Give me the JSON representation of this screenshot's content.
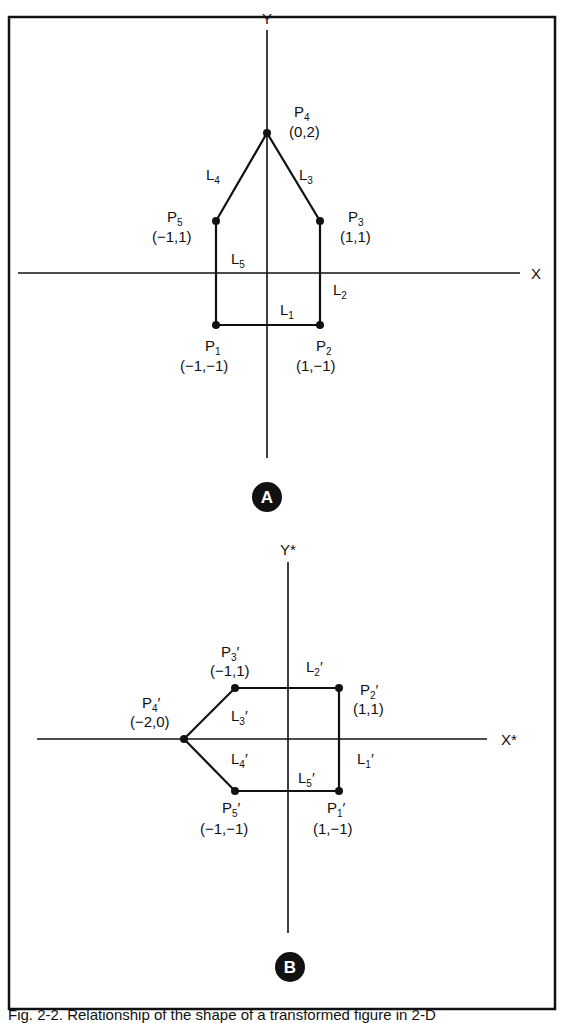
{
  "figure": {
    "caption": "Fig. 2-2. Relationship of the shape of a transformed figure in 2-D",
    "panel_a": {
      "badge": "A",
      "x_axis_label": "X",
      "y_axis_label": "Y",
      "points": [
        {
          "name": "P",
          "sub": "1",
          "coord": "(−1,−1)",
          "x": -1,
          "y": -1
        },
        {
          "name": "P",
          "sub": "2",
          "coord": "(1,−1)",
          "x": 1,
          "y": -1
        },
        {
          "name": "P",
          "sub": "3",
          "coord": "(1,1)",
          "x": 1,
          "y": 1
        },
        {
          "name": "P",
          "sub": "4",
          "coord": "(0,2)",
          "x": 0,
          "y": 2
        },
        {
          "name": "P",
          "sub": "5",
          "coord": "(−1,1)",
          "x": -1,
          "y": 1
        }
      ],
      "lines": [
        {
          "name": "L",
          "sub": "1",
          "from": "P1",
          "to": "P2"
        },
        {
          "name": "L",
          "sub": "2",
          "from": "P2",
          "to": "P3"
        },
        {
          "name": "L",
          "sub": "3",
          "from": "P3",
          "to": "P4"
        },
        {
          "name": "L",
          "sub": "4",
          "from": "P4",
          "to": "P5"
        },
        {
          "name": "L",
          "sub": "5",
          "from": "P5",
          "to": "P1"
        }
      ]
    },
    "panel_b": {
      "badge": "B",
      "x_axis_label": "X*",
      "y_axis_label": "Y*",
      "points": [
        {
          "name": "P",
          "sub": "1",
          "prime": "′",
          "coord": "(1,−1)",
          "x": 1,
          "y": -1
        },
        {
          "name": "P",
          "sub": "2",
          "prime": "′",
          "coord": "(1,1)",
          "x": 1,
          "y": 1
        },
        {
          "name": "P",
          "sub": "3",
          "prime": "′",
          "coord": "(−1,1)",
          "x": -1,
          "y": 1
        },
        {
          "name": "P",
          "sub": "4",
          "prime": "′",
          "coord": "(−2,0)",
          "x": -2,
          "y": 0
        },
        {
          "name": "P",
          "sub": "5",
          "prime": "′",
          "coord": "(−1,−1)",
          "x": -1,
          "y": -1
        }
      ],
      "lines": [
        {
          "name": "L",
          "sub": "1",
          "prime": "′",
          "from": "P1'",
          "to": "P2'"
        },
        {
          "name": "L",
          "sub": "2",
          "prime": "′",
          "from": "P2'",
          "to": "P3'"
        },
        {
          "name": "L",
          "sub": "3",
          "prime": "′",
          "from": "P3'",
          "to": "P4'"
        },
        {
          "name": "L",
          "sub": "4",
          "prime": "′",
          "from": "P4'",
          "to": "P5'"
        },
        {
          "name": "L",
          "sub": "5",
          "prime": "′",
          "from": "P5'",
          "to": "P1'"
        }
      ]
    }
  }
}
